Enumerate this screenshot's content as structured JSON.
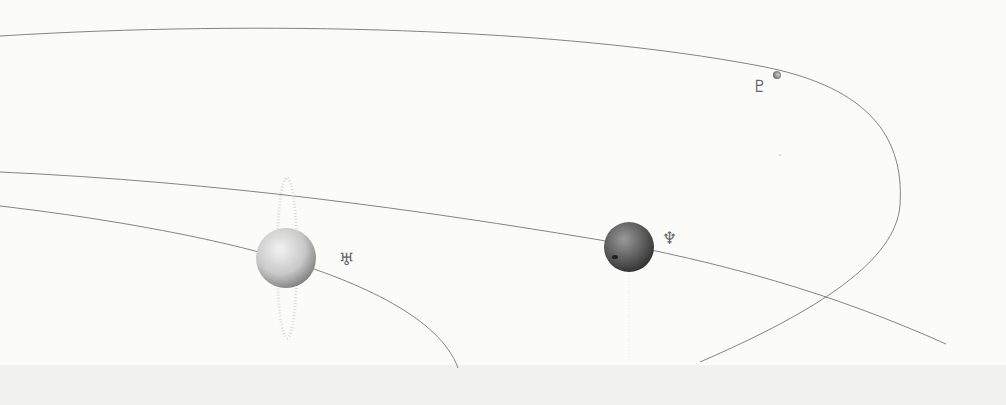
{
  "colors": {
    "background": "#fbfbfa",
    "orbit_line": "#777777",
    "footer_band": "#f1f1ef",
    "uranus_light": "#ececec",
    "uranus_dark": "#8a8a8a",
    "neptune_light": "#8c8c8c",
    "neptune_dark": "#3a3a3a",
    "pluto": "#999999",
    "symbol": "#666666"
  },
  "planets": [
    {
      "name": "Uranus",
      "symbol": "♅"
    },
    {
      "name": "Neptune",
      "symbol": "♆"
    },
    {
      "name": "Pluto",
      "symbol": "♇"
    }
  ]
}
